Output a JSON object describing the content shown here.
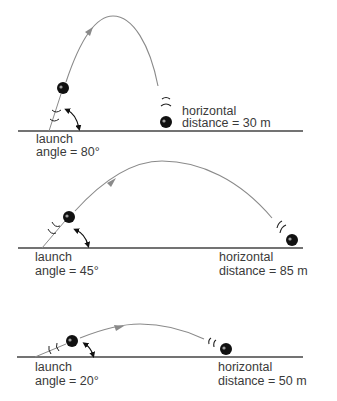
{
  "colors": {
    "trajectory": "#8a8a8a",
    "ground": "#444444",
    "ball": "#111111",
    "text": "#3a3a3a"
  },
  "panels": [
    {
      "launch_label": "launch",
      "angle_label": "angle = 80°",
      "angle_deg": 80,
      "horizontal_label": "horizontal",
      "distance_label": "distance = 30 m",
      "distance_m": 30
    },
    {
      "launch_label": "launch",
      "angle_label": "angle = 45°",
      "angle_deg": 45,
      "horizontal_label": "horizontal",
      "distance_label": "distance = 85 m",
      "distance_m": 85
    },
    {
      "launch_label": "launch",
      "angle_label": "angle = 20°",
      "angle_deg": 20,
      "horizontal_label": "horizontal",
      "distance_label": "distance = 50 m",
      "distance_m": 50
    }
  ],
  "icons": {
    "ball": "filled-circle",
    "motion_marks": "arc-lines",
    "angle_arrow": "curved-double-arrow"
  }
}
